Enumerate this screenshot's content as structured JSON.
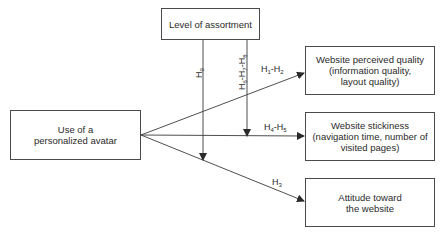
{
  "diagram": {
    "nodes": {
      "moderator": {
        "label": "Level of assortment"
      },
      "independent": {
        "line1": "Use of a",
        "line2": "personalized avatar"
      },
      "perceived_quality": {
        "line1": "Website perceived quality",
        "line2": "(information quality,",
        "line3": "layout quality)"
      },
      "stickiness": {
        "line1": "Website stickiness",
        "line2": "(navigation time, number of",
        "line3": "visited pages)"
      },
      "attitude": {
        "line1": "Attitude toward",
        "line2": "the website"
      }
    },
    "edges": {
      "h1_h2": {
        "a": "H",
        "a_sub": "1",
        "sep": "-",
        "b": "H",
        "b_sub": "2"
      },
      "h4_h5": {
        "a": "H",
        "a_sub": "4",
        "sep": "-",
        "b": "H",
        "b_sub": "5"
      },
      "h3": {
        "a": "H",
        "a_sub": "3"
      },
      "h9": {
        "a": "H",
        "a_sub": "9"
      },
      "h6_h7_h8": {
        "a": "H",
        "a_sub": "6",
        "sep1": "-",
        "b": "H",
        "b_sub": "7",
        "sep2": "-",
        "c": "H",
        "c_sub": "8"
      }
    },
    "colors": {
      "line": "#3a3a3a",
      "text": "#2a2a2a",
      "background": "#ffffff"
    }
  }
}
